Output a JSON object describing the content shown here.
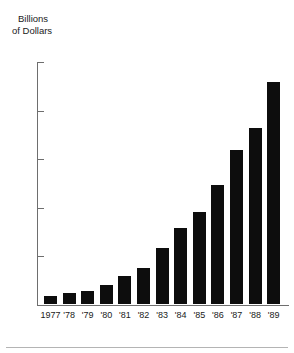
{
  "figure": {
    "title_sliver": "",
    "axis_title_line1": "Billions",
    "axis_title_line2": "of Dollars"
  },
  "chart_data": {
    "type": "bar",
    "title": "",
    "subtitle": "",
    "xlabel": "",
    "ylabel": "Billions of Dollars",
    "categories": [
      "1977",
      "'78",
      "'79",
      "'80",
      "'81",
      "'82",
      "'83",
      "'84",
      "'85",
      "'86",
      "'87",
      "'88",
      "'89"
    ],
    "values": [
      8,
      11,
      13,
      20,
      29,
      37,
      58,
      78,
      95,
      122,
      158,
      181,
      228
    ],
    "ylim": [
      0,
      250
    ],
    "yticks": [
      0,
      50,
      100,
      150,
      200,
      250
    ],
    "ytick_labels": [
      "0",
      "50",
      "100",
      "150",
      "200",
      "250"
    ],
    "grid": false,
    "legend": null,
    "bar_color": "#0d0d0d",
    "axis_color": "#6e6e6e"
  }
}
